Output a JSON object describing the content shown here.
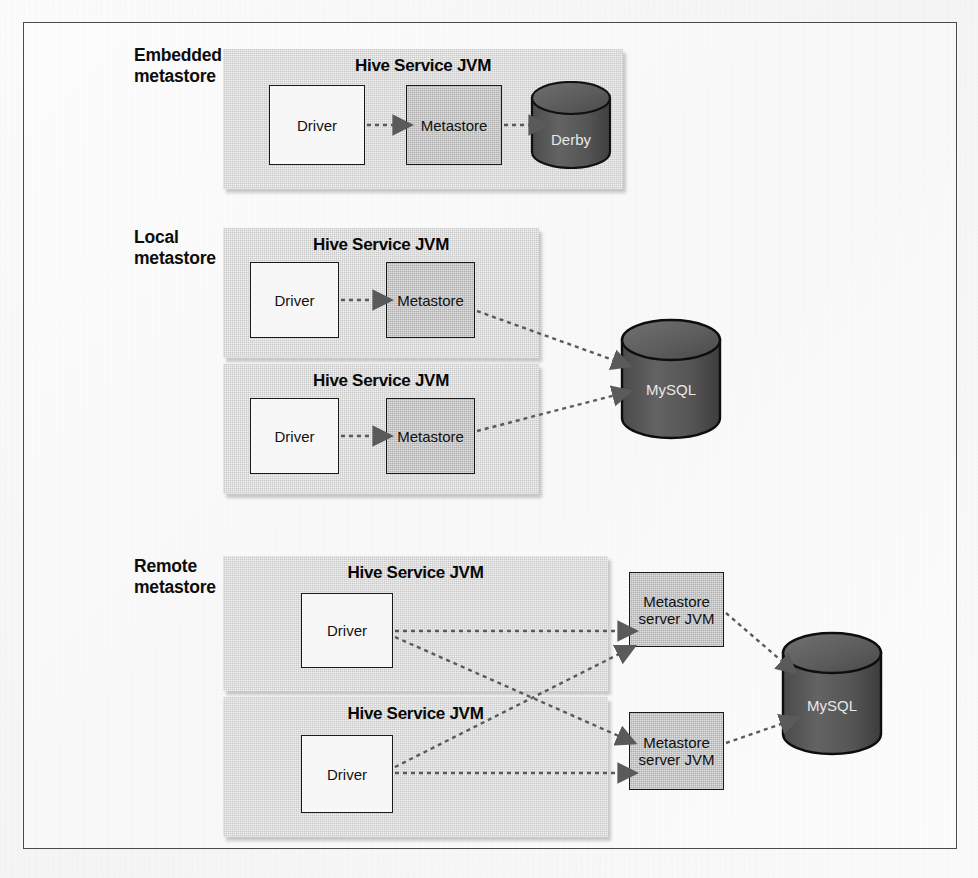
{
  "figure": {
    "caption": "",
    "sections": [
      {
        "id": "embedded",
        "label": "Embedded\nmetastore",
        "jvms": [
          {
            "title": "Hive Service JVM",
            "nodes": [
              {
                "label": "Driver",
                "style": "white"
              },
              {
                "label": "Metastore",
                "style": "gray"
              }
            ],
            "database": {
              "label": "Derby",
              "inside_jvm": true
            }
          }
        ]
      },
      {
        "id": "local",
        "label": "Local\nmetastore",
        "jvms": [
          {
            "title": "Hive Service JVM",
            "nodes": [
              {
                "label": "Driver",
                "style": "white"
              },
              {
                "label": "Metastore",
                "style": "gray"
              }
            ]
          },
          {
            "title": "Hive Service JVM",
            "nodes": [
              {
                "label": "Driver",
                "style": "white"
              },
              {
                "label": "Metastore",
                "style": "gray"
              }
            ]
          }
        ],
        "database": {
          "label": "MySQL",
          "inside_jvm": false
        }
      },
      {
        "id": "remote",
        "label": "Remote\nmetastore",
        "jvms": [
          {
            "title": "Hive Service JVM",
            "nodes": [
              {
                "label": "Driver",
                "style": "white"
              }
            ]
          },
          {
            "title": "Hive Service JVM",
            "nodes": [
              {
                "label": "Driver",
                "style": "white"
              }
            ]
          }
        ],
        "servers": [
          {
            "label": "Metastore\nserver JVM",
            "style": "gray"
          },
          {
            "label": "Metastore\nserver JVM",
            "style": "gray"
          }
        ],
        "database": {
          "label": "MySQL",
          "inside_jvm": false
        }
      }
    ]
  },
  "labels": {
    "embedded_section": "Embedded\nmetastore",
    "local_section": "Local\nmetastore",
    "remote_section": "Remote\nmetastore",
    "hive_service_jvm": "Hive Service JVM",
    "driver": "Driver",
    "metastore": "Metastore",
    "metastore_server_jvm_line1": "Metastore",
    "metastore_server_jvm_line2": "server JVM",
    "derby": "Derby",
    "mysql": "MySQL"
  },
  "colors": {
    "page_background": "#fbfbfb",
    "frame_border": "#4a4a4a",
    "jvm_fill": "#c9c9c9",
    "node_white_fill": "#f7f7f7",
    "node_gray_fill": "#b0b0b0",
    "node_border": "#1a1a1a",
    "cylinder_fill": "#5c5c5c",
    "cylinder_top": "#6e6e6e",
    "cylinder_border": "#111111",
    "arrow_color": "#555555",
    "text_color": "#111111",
    "db_text_color": "#e8e8e8"
  }
}
